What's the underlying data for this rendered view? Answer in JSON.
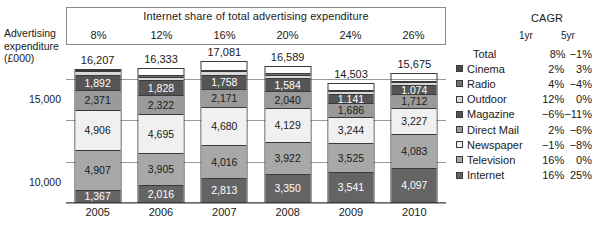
{
  "axis_title": "Advertising\nexpenditure\n(£000)",
  "axis_title_line1": "Advertising",
  "axis_title_line2": "expenditure",
  "axis_title_line3": "(£000)",
  "banner": {
    "title": "Internet share of total advertising expenditure",
    "values": [
      "8%",
      "12%",
      "16%",
      "20%",
      "24%",
      "26%"
    ]
  },
  "cagr": {
    "title": "CAGR",
    "col1": "1yr",
    "col2": "5yr",
    "rows": [
      {
        "name": "Total",
        "swatch": "none",
        "y1": "8%",
        "y5": "−1%"
      },
      {
        "name": "Cinema",
        "swatch": "#4a4a4a",
        "y1": "2%",
        "y5": "3%"
      },
      {
        "name": "Radio",
        "swatch": "#6e6e6e",
        "y1": "4%",
        "y5": "−4%"
      },
      {
        "name": "Outdoor",
        "swatch": "#d8d8d8",
        "y1": "12%",
        "y5": "0%"
      },
      {
        "name": "Magazine",
        "swatch": "#555555",
        "y1": "−6%",
        "y5": "−11%"
      },
      {
        "name": "Direct Mail",
        "swatch": "#9a9a9a",
        "y1": "2%",
        "y5": "−6%"
      },
      {
        "name": "Newspaper",
        "swatch": "#f0f0f0",
        "y1": "−1%",
        "y5": "−8%"
      },
      {
        "name": "Television",
        "swatch": "#a8a8a8",
        "y1": "16%",
        "y5": "0%"
      },
      {
        "name": "Internet",
        "swatch": "#646464",
        "y1": "16%",
        "y5": "25%"
      }
    ]
  },
  "y_ticks": [
    "15,000",
    "10,000",
    "5,000",
    "0"
  ],
  "chart_data": {
    "type": "bar",
    "subtype": "stacked-column",
    "title": "Internet share of total advertising expenditure",
    "xlabel": "",
    "ylabel": "Advertising expenditure (£000)",
    "ylim": [
      0,
      17500
    ],
    "y_ticks": [
      0,
      5000,
      10000,
      15000
    ],
    "grid": true,
    "legend_position": "right",
    "categories": [
      "2005",
      "2006",
      "2007",
      "2008",
      "2009",
      "2010"
    ],
    "totals": [
      "16,207",
      "16,333",
      "17,081",
      "16,589",
      "14,503",
      "15,675"
    ],
    "totals_numeric": [
      16207,
      16333,
      17081,
      16589,
      14503,
      15675
    ],
    "internet_share": [
      "8%",
      "12%",
      "16%",
      "20%",
      "24%",
      "26%"
    ],
    "stack_order_bottom_to_top": [
      "Internet",
      "Television",
      "Newspaper",
      "Direct Mail",
      "Magazine",
      "Outdoor",
      "Radio",
      "Cinema"
    ],
    "series": [
      {
        "name": "Internet",
        "color": "#646464",
        "values": [
          1367,
          2016,
          2813,
          3350,
          3541,
          4097
        ],
        "labels": [
          "1,367",
          "2,016",
          "2,813",
          "3,350",
          "3,541",
          "4,097"
        ]
      },
      {
        "name": "Television",
        "color": "#a8a8a8",
        "values": [
          4907,
          3905,
          4016,
          3922,
          3525,
          4083
        ],
        "labels": [
          "4,907",
          "3,905",
          "4,016",
          "3,922",
          "3,525",
          "4,083"
        ]
      },
      {
        "name": "Newspaper",
        "color": "#f0f0f0",
        "values": [
          4906,
          4695,
          4680,
          4129,
          3244,
          3227
        ],
        "labels": [
          "4,906",
          "4,695",
          "4,680",
          "4,129",
          "3,244",
          "3,227"
        ]
      },
      {
        "name": "Direct Mail",
        "color": "#9a9a9a",
        "values": [
          2371,
          2322,
          2171,
          2040,
          1686,
          1712
        ],
        "labels": [
          "2,371",
          "2,322",
          "2,171",
          "2,040",
          "1,686",
          "1,712"
        ]
      },
      {
        "name": "Magazine",
        "color": "#555555",
        "values": [
          1892,
          1828,
          1758,
          1584,
          1141,
          1074
        ],
        "labels": [
          "1,892",
          "1,828",
          "1,758",
          "1,584",
          "1,141",
          "1,074"
        ]
      },
      {
        "name": "Outdoor",
        "color": "#d8d8d8",
        "values": [
          430,
          440,
          450,
          430,
          390,
          400
        ],
        "labels": [
          "",
          "",
          "",
          "",
          "",
          ""
        ]
      },
      {
        "name": "Radio",
        "color": "#6e6e6e",
        "values": [
          180,
          180,
          190,
          180,
          160,
          160
        ],
        "labels": [
          "",
          "",
          "",
          "",
          "",
          ""
        ]
      },
      {
        "name": "Cinema",
        "color": "#4a4a4a",
        "values": [
          154,
          147,
          153,
          144,
          126,
          132
        ],
        "labels": [
          "",
          "",
          "",
          "",
          "",
          ""
        ]
      }
    ],
    "cagr_table": {
      "columns": [
        "1yr",
        "5yr"
      ],
      "rows": [
        {
          "name": "Total",
          "1yr": "8%",
          "5yr": "-1%"
        },
        {
          "name": "Cinema",
          "1yr": "2%",
          "5yr": "3%"
        },
        {
          "name": "Radio",
          "1yr": "4%",
          "5yr": "-4%"
        },
        {
          "name": "Outdoor",
          "1yr": "12%",
          "5yr": "0%"
        },
        {
          "name": "Magazine",
          "1yr": "-6%",
          "5yr": "-11%"
        },
        {
          "name": "Direct Mail",
          "1yr": "2%",
          "5yr": "-6%"
        },
        {
          "name": "Newspaper",
          "1yr": "-1%",
          "5yr": "-8%"
        },
        {
          "name": "Television",
          "1yr": "16%",
          "5yr": "0%"
        },
        {
          "name": "Internet",
          "1yr": "16%",
          "5yr": "25%"
        }
      ]
    }
  }
}
